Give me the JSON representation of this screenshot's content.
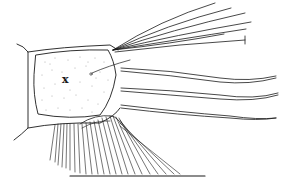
{
  "figure": {
    "type": "scientific line illustration",
    "labels": [
      {
        "text": "x",
        "x": 66,
        "y": 82
      }
    ],
    "colors": {
      "ink": "#1a1a1a",
      "paper": "#ffffff"
    }
  }
}
